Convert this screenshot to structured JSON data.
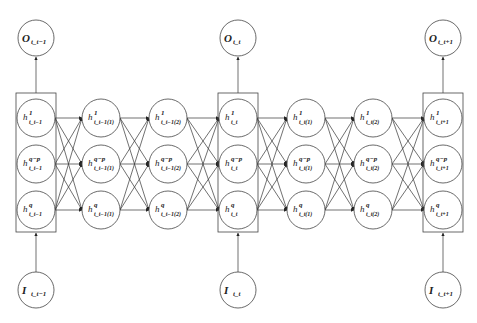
{
  "diagram": {
    "type": "recurrent neural network unrolled across time steps",
    "outputs": [
      {
        "id": "o_prev",
        "label": "O",
        "sub": "t_t−1",
        "cx": 36
      },
      {
        "id": "o_curr",
        "label": "O",
        "sub": "t_t",
        "cx": 238
      },
      {
        "id": "o_next",
        "label": "O",
        "sub": "t_t+1",
        "cx": 443
      }
    ],
    "inputs": [
      {
        "id": "i_prev",
        "label": "I",
        "sub": "t_t−1",
        "cx": 36
      },
      {
        "id": "i_curr",
        "label": "I",
        "sub": "t_t",
        "cx": 238
      },
      {
        "id": "i_next",
        "label": "I",
        "sub": "t_t+1",
        "cx": 443
      }
    ],
    "columns": [
      {
        "id": "c0",
        "cx": 36,
        "boxed": true,
        "subs": [
          "t_t−1",
          "t_t−1",
          "t_t−1"
        ]
      },
      {
        "id": "c1",
        "cx": 101,
        "boxed": false,
        "subs": [
          "t_t−1(1)",
          "t_t−1(1)",
          "t_t−1(1)"
        ]
      },
      {
        "id": "c2",
        "cx": 168,
        "boxed": false,
        "subs": [
          "t_t−1(2)",
          "t_t−1(2)",
          "t_t−1(2)"
        ]
      },
      {
        "id": "c3",
        "cx": 238,
        "boxed": true,
        "subs": [
          "t_t",
          "t_t",
          "t_t"
        ]
      },
      {
        "id": "c4",
        "cx": 306,
        "boxed": false,
        "subs": [
          "t_t(1)",
          "t_t(1)",
          "t_t(1)"
        ]
      },
      {
        "id": "c5",
        "cx": 373,
        "boxed": false,
        "subs": [
          "t_t(2)",
          "t_t(2)",
          "t_t(2)"
        ]
      },
      {
        "id": "c6",
        "cx": 443,
        "boxed": true,
        "subs": [
          "t_t+1",
          "t_t+1",
          "t_t+1"
        ]
      }
    ],
    "rows": [
      {
        "id": "r0",
        "cy": 118,
        "sup": "1"
      },
      {
        "id": "r1",
        "cy": 164,
        "sup": "q−p"
      },
      {
        "id": "r2",
        "cy": 210,
        "sup": "q"
      }
    ],
    "hidden_label": "h",
    "geometry": {
      "node_r": 19,
      "io_r": 18,
      "output_cy": 38,
      "input_cy": 290,
      "box_half_w": 20,
      "box_top": 93,
      "box_bottom": 232
    }
  }
}
